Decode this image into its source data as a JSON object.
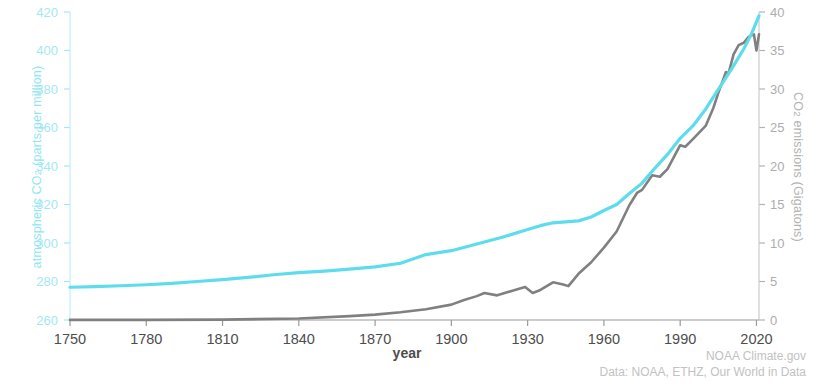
{
  "chart_data": {
    "type": "line",
    "title": "",
    "xlabel": "year",
    "ylabel": "atmospheric CO2 (parts per million)",
    "ylabel_right": "CO2 emissions (Gigatons)",
    "xlim": [
      1750,
      2021
    ],
    "ylim": [
      260,
      420
    ],
    "ylim_right": [
      0,
      40
    ],
    "grid": false,
    "legend_position": "none",
    "xticks": [
      1750,
      1780,
      1810,
      1840,
      1870,
      1900,
      1930,
      1960,
      1990,
      2020
    ],
    "yticks_left": [
      260,
      280,
      300,
      320,
      340,
      360,
      380,
      400,
      420
    ],
    "yticks_right": [
      0,
      5,
      10,
      15,
      20,
      25,
      30,
      35,
      40
    ],
    "series": [
      {
        "name": "atmospheric CO2",
        "axis": "left",
        "color": "#5DDDEC",
        "units": "ppm",
        "x": [
          1750,
          1760,
          1770,
          1780,
          1790,
          1800,
          1810,
          1820,
          1830,
          1840,
          1850,
          1860,
          1870,
          1880,
          1890,
          1900,
          1910,
          1920,
          1930,
          1935,
          1940,
          1945,
          1950,
          1955,
          1960,
          1965,
          1970,
          1975,
          1980,
          1985,
          1990,
          1995,
          2000,
          2005,
          2010,
          2015,
          2018,
          2021
        ],
        "values": [
          277.0,
          277.3,
          277.8,
          278.3,
          279.0,
          280.0,
          281.0,
          282.1,
          283.5,
          284.6,
          285.4,
          286.4,
          287.6,
          289.5,
          294.0,
          296.0,
          299.5,
          303.0,
          307.0,
          309.0,
          310.5,
          311.0,
          311.5,
          313.5,
          316.9,
          320.0,
          325.7,
          331.1,
          338.8,
          346.0,
          354.4,
          360.8,
          369.5,
          379.8,
          389.9,
          400.8,
          408.5,
          418.0
        ]
      },
      {
        "name": "CO2 emissions",
        "axis": "right",
        "color": "#808080",
        "units": "Gigatons",
        "x": [
          1750,
          1780,
          1810,
          1840,
          1860,
          1870,
          1880,
          1890,
          1900,
          1905,
          1910,
          1913,
          1918,
          1920,
          1925,
          1929,
          1932,
          1935,
          1940,
          1944,
          1946,
          1950,
          1955,
          1960,
          1965,
          1970,
          1973,
          1975,
          1979,
          1982,
          1985,
          1990,
          1992,
          1995,
          2000,
          2003,
          2005,
          2008,
          2009,
          2011,
          2013,
          2015,
          2017,
          2019,
          2020,
          2021
        ],
        "values": [
          0.01,
          0.02,
          0.05,
          0.2,
          0.5,
          0.7,
          1.0,
          1.4,
          2.0,
          2.6,
          3.1,
          3.5,
          3.2,
          3.4,
          3.9,
          4.3,
          3.5,
          3.9,
          4.9,
          4.6,
          4.4,
          6.0,
          7.5,
          9.4,
          11.5,
          14.9,
          16.5,
          16.9,
          18.8,
          18.6,
          19.6,
          22.7,
          22.5,
          23.5,
          25.2,
          27.5,
          29.5,
          32.2,
          32.0,
          34.5,
          35.7,
          36.0,
          36.8,
          37.1,
          35.0,
          37.1
        ]
      }
    ],
    "annotations": []
  },
  "axes": {
    "left": {
      "title_main": "atmospheric CO",
      "title_sub": "2",
      "title_tail": " (parts per million)",
      "color": "#9fe9f4",
      "tick_labels": [
        "420",
        "400",
        "380",
        "360",
        "340",
        "320",
        "300",
        "280",
        "260"
      ]
    },
    "right": {
      "title_main": "CO",
      "title_sub": "2",
      "title_tail": " emissions (Gigatons)",
      "color": "#b3b3b3",
      "tick_labels": [
        "40",
        "35",
        "30",
        "25",
        "20",
        "15",
        "10",
        "5",
        "0"
      ]
    },
    "bottom": {
      "title": "year",
      "tick_labels": [
        "1750",
        "1780",
        "1810",
        "1840",
        "1870",
        "1900",
        "1930",
        "1960",
        "1990",
        "2020"
      ]
    }
  },
  "credits": {
    "line1": "NOAA Climate.gov",
    "line2": "Data: NOAA, ETHZ, Our World in Data"
  },
  "colors": {
    "co2_line": "#5DDDEC",
    "emissions_line": "#808080",
    "left_axis": "#9fe9f4",
    "right_axis": "#b3b3b3",
    "text_dark": "#4d4d4d",
    "background": "#ffffff"
  }
}
